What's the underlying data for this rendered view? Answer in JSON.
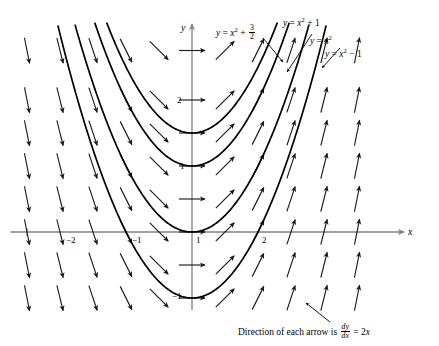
{
  "figure": {
    "kind": "slope-field-with-solution-curves",
    "caption_prefix": "Direction of each arrow is",
    "caption_frac_num": "dy",
    "caption_frac_den": "dx",
    "caption_suffix": "= 2x",
    "axis_x_label": "x",
    "axis_y_label": "y"
  },
  "curve_labels": [
    {
      "id": "c-3-2",
      "y_txt": "y",
      "eq_txt": "= x",
      "exp": "2",
      "op": "+",
      "frac_num": "3",
      "frac_den": "2",
      "const": ""
    },
    {
      "id": "c-plus1",
      "y_txt": "y",
      "eq_txt": "= x",
      "exp": "2",
      "op": "+",
      "frac_num": "",
      "frac_den": "",
      "const": "1"
    },
    {
      "id": "c-zero",
      "y_txt": "y",
      "eq_txt": "= x",
      "exp": "2",
      "op": "",
      "frac_num": "",
      "frac_den": "",
      "const": ""
    },
    {
      "id": "c-minus1",
      "y_txt": "y",
      "eq_txt": "= x",
      "exp": "2",
      "op": "−",
      "frac_num": "",
      "frac_den": "",
      "const": "1"
    }
  ],
  "ticks": {
    "x": [
      {
        "label": "−2",
        "value": -2
      },
      {
        "label": "−1",
        "value": -1
      },
      {
        "label": "1",
        "value": 1
      },
      {
        "label": "2",
        "value": 2
      }
    ],
    "y": [
      {
        "label": "2",
        "value": 2
      },
      {
        "label": "1",
        "value": 1
      },
      {
        "label": "−1",
        "value": -1
      }
    ],
    "x_unlabeled": [
      -2.5
    ]
  },
  "chart_data": {
    "type": "line",
    "title": "",
    "xlabel": "x",
    "ylabel": "y",
    "xlim": [
      -2.75,
      3.15
    ],
    "ylim": [
      -1.6,
      3.1
    ],
    "grid": false,
    "legend": "inline-curve-labels",
    "slope_field": {
      "formula": "dy/dx = 2x",
      "x_grid": [
        -2.5,
        -2,
        -1.5,
        -1,
        -0.5,
        0,
        0.5,
        1,
        1.5,
        2,
        2.5
      ],
      "y_grid": [
        2.75,
        2,
        1.5,
        1,
        0.5,
        0,
        -0.5,
        -1
      ],
      "arrow_length": 26,
      "note": "slope at each node equals 2x, independent of y"
    },
    "series": [
      {
        "name": "y = x² + 3/2",
        "c": 1.5,
        "formula": "y = x^2 + 1.5"
      },
      {
        "name": "y = x² + 1",
        "c": 1.0,
        "formula": "y = x^2 + 1"
      },
      {
        "name": "y = x²",
        "c": 0.0,
        "formula": "y = x^2"
      },
      {
        "name": "y = x² − 1",
        "c": -1.0,
        "formula": "y = x^2 - 1"
      }
    ],
    "axis_color": "#808080",
    "curve_color": "#000000",
    "arrow_color": "#1a1a1a"
  }
}
